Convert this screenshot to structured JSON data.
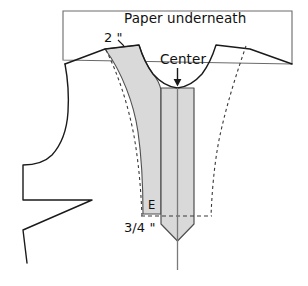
{
  "diagram": {
    "labels": {
      "paper_underneath": "Paper underneath",
      "center": "Center",
      "two_inch": "2 \"",
      "three_quarter_inch": "3/4 \"",
      "point_e": "E"
    },
    "colors": {
      "background": "#ffffff",
      "outline": "#1a1a1a",
      "shade_fill": "#d9d9d9",
      "shade_stroke": "#4d4d4d",
      "dashed_stroke": "#3a3a3a",
      "paper_stroke": "#555555",
      "center_line": "#6e6e6e",
      "text": "#111111"
    },
    "elements": {
      "paper_sheet": "rectangle outline behind the pattern, labelled Paper underneath",
      "bodice_outline": "front bodice pattern piece with shoulder, armhole and side notches",
      "neckline_curve": "scooped neckline arc at the center top",
      "shaded_left_panel": "grey shaded facing panel left of center",
      "center_strip": "grey shaded vertical strip running down the center to a point",
      "center_arrow": "downward arrow marking the center line",
      "dashed_guideline_left": "dashed curved guideline on the left of the facing",
      "dashed_guideline_right": "dashed curved guideline on the right side",
      "dashed_horizontal_E": "dashed horizontal line through point E",
      "dashed_box_bottom": "dashed rectangle bottom marking the 3/4 inch depth"
    },
    "measurements": [
      {
        "name": "shoulder-to-facing-width",
        "value": "2 \"",
        "unit": "inch"
      },
      {
        "name": "center-strip-half-width",
        "value": "3/4 \"",
        "unit": "inch"
      }
    ],
    "points": [
      {
        "name": "E",
        "label": "E"
      }
    ]
  }
}
